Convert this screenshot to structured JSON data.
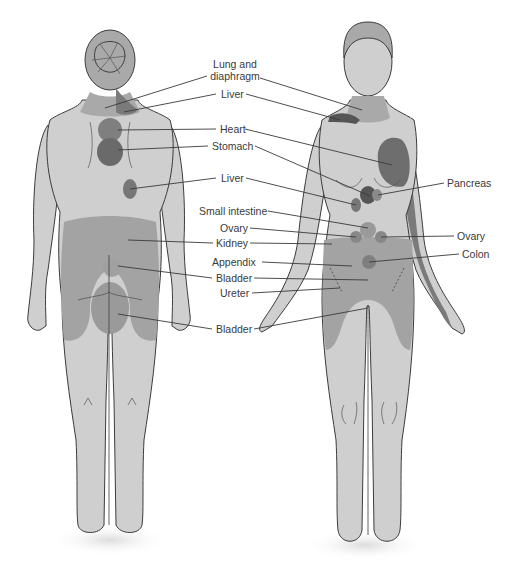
{
  "figures": {
    "back": {
      "name": "Back view"
    },
    "front": {
      "name": "Front view"
    }
  },
  "labels": [
    {
      "id": "lung-diaphragm",
      "text": "Lung and\ndiaphragm",
      "x": 210,
      "y": 61
    },
    {
      "id": "liver-1",
      "text": "Liver",
      "x": 221,
      "y": 89
    },
    {
      "id": "heart",
      "text": "Heart",
      "x": 220,
      "y": 124
    },
    {
      "id": "stomach",
      "text": "Stomach",
      "x": 212,
      "y": 141
    },
    {
      "id": "liver-2",
      "text": "Liver",
      "x": 221,
      "y": 173
    },
    {
      "id": "small-intestine",
      "text": "Small intestine",
      "x": 200,
      "y": 206
    },
    {
      "id": "ovary-left",
      "text": "Ovary",
      "x": 220,
      "y": 223
    },
    {
      "id": "kidney",
      "text": "Kidney",
      "x": 217,
      "y": 238
    },
    {
      "id": "appendix",
      "text": "Appendix",
      "x": 212,
      "y": 257
    },
    {
      "id": "bladder-1",
      "text": "Bladder",
      "x": 216,
      "y": 273
    },
    {
      "id": "ureter",
      "text": "Ureter",
      "x": 220,
      "y": 288
    },
    {
      "id": "bladder-2",
      "text": "Bladder",
      "x": 216,
      "y": 324
    },
    {
      "id": "pancreas",
      "text": "Pancreas",
      "x": 447,
      "y": 178
    },
    {
      "id": "ovary-right",
      "text": "Ovary",
      "x": 457,
      "y": 231
    },
    {
      "id": "colon",
      "text": "Colon",
      "x": 462,
      "y": 249
    }
  ],
  "colors": {
    "skin": "#cfcfcf",
    "zone_light": "#a9a9a9",
    "zone_mid": "#8e8e8e",
    "zone_dark": "#6f6f6f",
    "outline": "#3c3c3c",
    "leader": "#3a3a3a"
  }
}
